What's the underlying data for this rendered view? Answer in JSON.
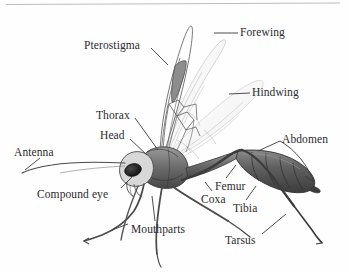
{
  "figure": {
    "kind": "scientific-illustration",
    "background_color": "#fefefe",
    "ink_color": "#2b2b2b",
    "top_rule_color": "#a8a8a8"
  },
  "labels": {
    "forewing": "Forewing",
    "pterostigma": "Pterostigma",
    "hindwing": "Hindwing",
    "thorax": "Thorax",
    "head": "Head",
    "abdomen": "Abdomen",
    "antenna": "Antenna",
    "compound_eye": "Compound eye",
    "femur": "Femur",
    "coxa": "Coxa",
    "tibia": "Tibia",
    "mouthparts": "Mouthparts",
    "tarsus": "Tarsus"
  },
  "label_list": [
    {
      "id": "forewing",
      "text": "Forewing",
      "side": "right"
    },
    {
      "id": "pterostigma",
      "text": "Pterostigma",
      "side": "left"
    },
    {
      "id": "hindwing",
      "text": "Hindwing",
      "side": "right"
    },
    {
      "id": "thorax",
      "text": "Thorax",
      "side": "left"
    },
    {
      "id": "head",
      "text": "Head",
      "side": "left"
    },
    {
      "id": "abdomen",
      "text": "Abdomen",
      "side": "right"
    },
    {
      "id": "antenna",
      "text": "Antenna",
      "side": "left"
    },
    {
      "id": "compound_eye",
      "text": "Compound eye",
      "side": "left"
    },
    {
      "id": "femur",
      "text": "Femur",
      "side": "right"
    },
    {
      "id": "coxa",
      "text": "Coxa",
      "side": "right"
    },
    {
      "id": "tibia",
      "text": "Tibia",
      "side": "right"
    },
    {
      "id": "mouthparts",
      "text": "Mouthparts",
      "side": "bottom"
    },
    {
      "id": "tarsus",
      "text": "Tarsus",
      "side": "bottom"
    }
  ]
}
